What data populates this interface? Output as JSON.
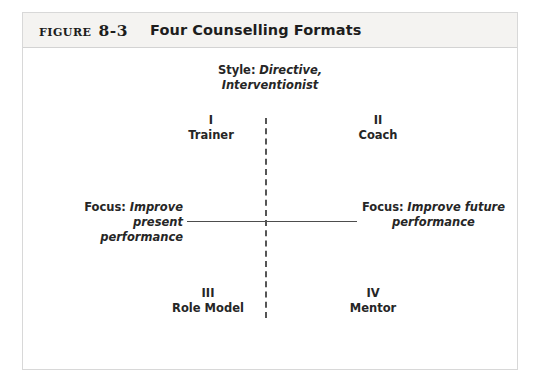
{
  "figure": {
    "label_small_caps": "Figure",
    "number": "8-3",
    "title": "Four Counselling Formats"
  },
  "diagram": {
    "type": "2x2-matrix",
    "vertical_axis_style": "dashed",
    "horizontal_axis_style": "solid",
    "style_top": {
      "head": "Style:",
      "value_line1": "Directive,",
      "value_line2": "Interventionist"
    },
    "style_bottom": {
      "head": "Style:",
      "value_line1": "Indirect,",
      "value_line2": "Reassuring"
    },
    "focus_left": {
      "head": "Focus:",
      "value_line1": "Improve present",
      "value_line2": "performance"
    },
    "focus_right": {
      "head": "Focus:",
      "value_line1": "Improve future",
      "value_line2": "performance"
    },
    "quadrants": [
      {
        "roman": "I",
        "name": "Trainer",
        "position": "top-left"
      },
      {
        "roman": "II",
        "name": "Coach",
        "position": "top-right"
      },
      {
        "roman": "III",
        "name": "Role Model",
        "position": "bottom-left"
      },
      {
        "roman": "IV",
        "name": "Mentor",
        "position": "bottom-right"
      }
    ]
  },
  "colors": {
    "page_background": "#ffffff",
    "frame_border": "#d8d8d8",
    "header_band": "#f4f3f1",
    "text": "#262626",
    "axis": "#4d4d4d"
  }
}
